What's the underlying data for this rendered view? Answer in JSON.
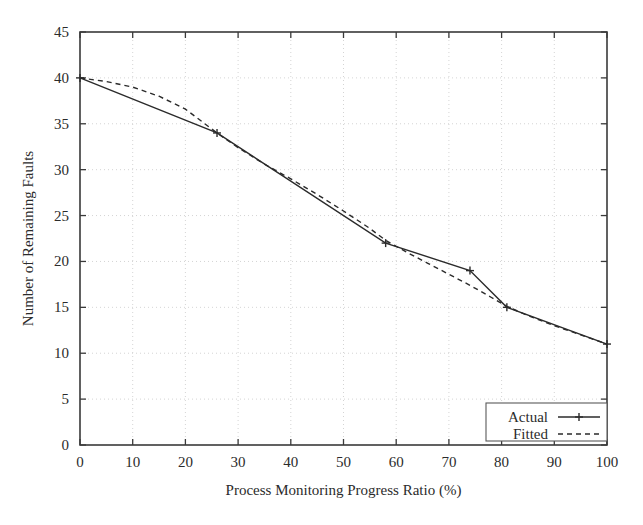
{
  "chart_data": {
    "type": "line",
    "title": "",
    "xlabel": "Process Monitoring Progress Ratio (%)",
    "ylabel": "Number of Remaining Faults",
    "xlim": [
      0,
      100
    ],
    "ylim": [
      0,
      45
    ],
    "xticks": [
      0,
      10,
      20,
      30,
      40,
      50,
      60,
      70,
      80,
      90,
      100
    ],
    "yticks": [
      0,
      5,
      10,
      15,
      20,
      25,
      30,
      35,
      40,
      45
    ],
    "xtick_labels": [
      "0",
      "10",
      "20",
      "30",
      "40",
      "50",
      "60",
      "70",
      "80",
      "90",
      "100"
    ],
    "ytick_labels": [
      "0",
      "5",
      "10",
      "15",
      "20",
      "25",
      "30",
      "35",
      "40",
      "45"
    ],
    "grid": true,
    "legend_position": "bottom-right",
    "series": [
      {
        "name": "Actual",
        "style": "solid",
        "marker": "plus",
        "color": "#2b2b2b",
        "x": [
          0,
          26,
          58,
          74,
          81,
          100
        ],
        "y": [
          40,
          34,
          22,
          19,
          15,
          11
        ]
      },
      {
        "name": "Fitted",
        "style": "dashed",
        "marker": "none",
        "color": "#2b2b2b",
        "x": [
          0,
          5,
          10,
          15,
          20,
          26,
          30,
          35,
          40,
          45,
          50,
          55,
          58,
          62,
          66,
          70,
          74,
          78,
          81,
          85,
          90,
          95,
          100
        ],
        "y": [
          40.0,
          39.6,
          39.0,
          38.0,
          36.6,
          34.0,
          32.4,
          30.6,
          29.0,
          27.3,
          25.5,
          23.6,
          22.3,
          21.0,
          19.8,
          18.6,
          17.4,
          16.1,
          15.1,
          14.1,
          13.0,
          12.0,
          11.0
        ]
      }
    ]
  },
  "legend": {
    "entries": [
      {
        "label": "Actual",
        "style": "solid",
        "marker": "plus"
      },
      {
        "label": "Fitted",
        "style": "dashed",
        "marker": "none"
      }
    ]
  },
  "colors": {
    "ink": "#2b2b2b",
    "frame": "#3a3a3a",
    "grid": "#c9c9c9",
    "background": "#ffffff"
  }
}
